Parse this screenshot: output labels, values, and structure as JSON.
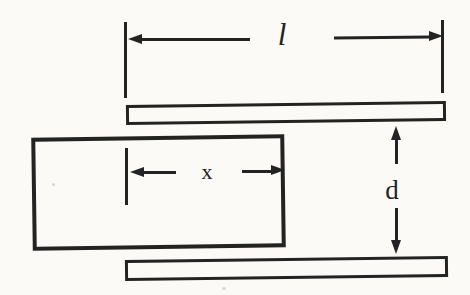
{
  "figure": {
    "labels": {
      "plate_length": "l",
      "overlap": "x",
      "plate_separation": "d"
    },
    "colors": {
      "ink": "#232323",
      "background": "#fbfaf7"
    }
  }
}
